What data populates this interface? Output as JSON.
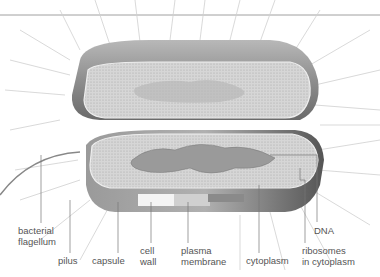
{
  "diagram": {
    "labels": [
      {
        "id": "bacterial-flagellum",
        "text": "bacterial\nflagellum",
        "x": 18,
        "y": 225
      },
      {
        "id": "pilus",
        "text": "pilus",
        "x": 58,
        "y": 255
      },
      {
        "id": "capsule",
        "text": "capsule",
        "x": 92,
        "y": 255
      },
      {
        "id": "cell-wall",
        "text": "cell\nwall",
        "x": 140,
        "y": 245
      },
      {
        "id": "plasma-membrane",
        "text": "plasma\nmembrane",
        "x": 181,
        "y": 245
      },
      {
        "id": "cytoplasm",
        "text": "cytoplasm",
        "x": 246,
        "y": 255
      },
      {
        "id": "dna",
        "text": "DNA",
        "x": 314,
        "y": 225
      },
      {
        "id": "ribosomes",
        "text": "ribosomes\nin cytoplasm",
        "x": 302,
        "y": 245
      }
    ],
    "colors": {
      "capsule": "#8a8a8a",
      "cytoplasm": "#d4d4d4",
      "dna": "#9a9a9a",
      "line": "#707070",
      "pili": "#c8c8c8"
    }
  }
}
